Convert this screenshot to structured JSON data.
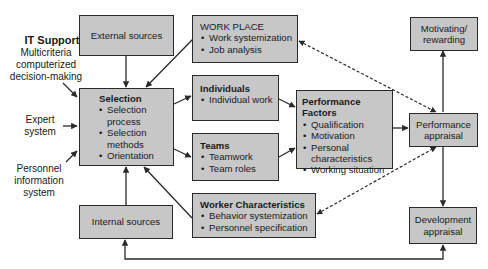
{
  "it_support": {
    "heading": "IT Support",
    "items": [
      "Multicriteria computerized decision-making",
      "Expert system",
      "Personnel information system"
    ],
    "lines": {
      "multicriteria": [
        "Multicriteria",
        "computerized",
        "decision-making"
      ],
      "expert": [
        "Expert",
        "system"
      ],
      "personnel": [
        "Personnel",
        "information",
        "system"
      ]
    }
  },
  "boxes": {
    "external_sources": {
      "title": "External sources"
    },
    "internal_sources": {
      "title": "Internal sources"
    },
    "work_place": {
      "title": "WORK PLACE",
      "items": [
        "Work systemization",
        "Job analysis"
      ]
    },
    "selection": {
      "title": "Selection",
      "items": [
        "Selection process",
        "Selection methods",
        "Orientation"
      ],
      "item_lines": [
        [
          "Selection",
          "process"
        ],
        [
          "Selection",
          "methods"
        ],
        [
          "Orientation"
        ]
      ]
    },
    "individuals": {
      "title": "Individuals",
      "items": [
        "Individual work"
      ]
    },
    "teams": {
      "title": "Teams",
      "items": [
        "Teamwork",
        "Team roles"
      ]
    },
    "worker_characteristics": {
      "title": "Worker Characteristics",
      "items": [
        "Behavior systemization",
        "Personnel specification"
      ]
    },
    "performance_factors": {
      "title": "Performance Factors",
      "items": [
        "Qualification",
        "Motivation",
        "Personal characteristics",
        "Working situation"
      ],
      "item_lines": [
        [
          "Qualification"
        ],
        [
          "Motivation"
        ],
        [
          "Personal",
          "characteristics"
        ],
        [
          "Working situation"
        ]
      ]
    },
    "motivating_rewarding": {
      "title_lines": [
        "Motivating/",
        "rewarding"
      ]
    },
    "performance_appraisal": {
      "title_lines": [
        "Performance",
        "appraisal"
      ]
    },
    "development_appraisal": {
      "title_lines": [
        "Development",
        "appraisal"
      ]
    }
  },
  "colors": {
    "box_fill": "#c7c7c7",
    "line": "#2a2a2a",
    "background": "#ffffff"
  }
}
